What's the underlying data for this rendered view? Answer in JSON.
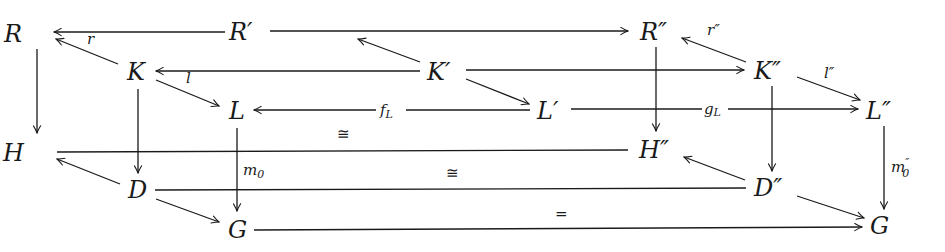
{
  "diagram": {
    "type": "commutative-diagram",
    "nodes": {
      "R": {
        "label": "R",
        "x": 14,
        "y": 42
      },
      "Rp": {
        "label": "R′",
        "x": 228,
        "y": 40
      },
      "Rpp": {
        "label": "R″",
        "x": 640,
        "y": 40
      },
      "K": {
        "label": "K",
        "x": 126,
        "y": 80
      },
      "Kp": {
        "label": "K′",
        "x": 428,
        "y": 79
      },
      "Kpp": {
        "label": "K″",
        "x": 754,
        "y": 79
      },
      "L": {
        "label": "L",
        "x": 228,
        "y": 119
      },
      "Lp": {
        "label": "L′",
        "x": 538,
        "y": 119
      },
      "Lpp": {
        "label": "L″",
        "x": 866,
        "y": 119
      },
      "H": {
        "label": "H",
        "x": 8,
        "y": 163
      },
      "Hpp": {
        "label": "H″",
        "x": 640,
        "y": 160
      },
      "D": {
        "label": "D",
        "x": 128,
        "y": 199
      },
      "Dpp": {
        "label": "D″",
        "x": 755,
        "y": 197
      },
      "G": {
        "label": "G",
        "x": 228,
        "y": 239
      },
      "G2": {
        "label": "G",
        "x": 870,
        "y": 235
      }
    },
    "edge_labels": {
      "r": {
        "text": "r",
        "x": 87,
        "y": 42
      },
      "l": {
        "text": "l",
        "x": 186,
        "y": 83
      },
      "rpp": {
        "text": "r″",
        "x": 710,
        "y": 36
      },
      "lpp": {
        "text": "l″",
        "x": 824,
        "y": 78
      },
      "fL": {
        "text": "fL",
        "x": 382,
        "y": 116
      },
      "gL": {
        "text": "gL",
        "x": 705,
        "y": 116
      },
      "m0": {
        "text": "m0",
        "x": 243,
        "y": 172
      },
      "m0pp": {
        "text": "m″0",
        "x": 891,
        "y": 174
      },
      "iso1": {
        "text": "≅",
        "x": 338,
        "y": 137
      },
      "iso2": {
        "text": "≅",
        "x": 446,
        "y": 178
      },
      "eq": {
        "text": "=",
        "x": 556,
        "y": 218
      }
    },
    "edges": [
      {
        "from": "Rp",
        "to": "R",
        "label": "",
        "kind": "arrow"
      },
      {
        "from": "Rp",
        "to": "Rpp",
        "label": "",
        "kind": "arrow"
      },
      {
        "from": "K",
        "to": "R",
        "label": "r",
        "kind": "arrow"
      },
      {
        "from": "Kp",
        "to": "Rp",
        "label": "",
        "kind": "arrow"
      },
      {
        "from": "Kpp",
        "to": "Rpp",
        "label": "r″",
        "kind": "arrow"
      },
      {
        "from": "Kp",
        "to": "K",
        "label": "l",
        "kind": "arrow"
      },
      {
        "from": "Kp",
        "to": "Kpp",
        "label": "",
        "kind": "arrow"
      },
      {
        "from": "K",
        "to": "L",
        "label": "",
        "kind": "arrow"
      },
      {
        "from": "Kp",
        "to": "Lp",
        "label": "",
        "kind": "arrow"
      },
      {
        "from": "Kpp",
        "to": "Lpp",
        "label": "l″",
        "kind": "arrow"
      },
      {
        "from": "Lp",
        "to": "L",
        "label": "fL",
        "kind": "arrow"
      },
      {
        "from": "Lp",
        "to": "Lpp",
        "label": "gL",
        "kind": "arrow"
      },
      {
        "from": "R",
        "to": "H",
        "label": "",
        "kind": "arrow"
      },
      {
        "from": "Rpp",
        "to": "Hpp",
        "label": "",
        "kind": "arrow"
      },
      {
        "from": "K",
        "to": "D",
        "label": "",
        "kind": "arrow"
      },
      {
        "from": "Kpp",
        "to": "Dpp",
        "label": "",
        "kind": "arrow"
      },
      {
        "from": "L",
        "to": "G",
        "label": "m0",
        "kind": "arrow"
      },
      {
        "from": "Lpp",
        "to": "G2",
        "label": "m″0",
        "kind": "arrow"
      },
      {
        "from": "H",
        "to": "Hpp",
        "label": "≅",
        "kind": "line"
      },
      {
        "from": "D",
        "to": "H",
        "label": "",
        "kind": "arrow"
      },
      {
        "from": "Dpp",
        "to": "Hpp",
        "label": "",
        "kind": "arrow"
      },
      {
        "from": "D",
        "to": "Dpp",
        "label": "≅",
        "kind": "line"
      },
      {
        "from": "D",
        "to": "G",
        "label": "",
        "kind": "arrow"
      },
      {
        "from": "Dpp",
        "to": "G2",
        "label": "",
        "kind": "arrow"
      },
      {
        "from": "G",
        "to": "G2",
        "label": "=",
        "kind": "arrow"
      }
    ]
  }
}
